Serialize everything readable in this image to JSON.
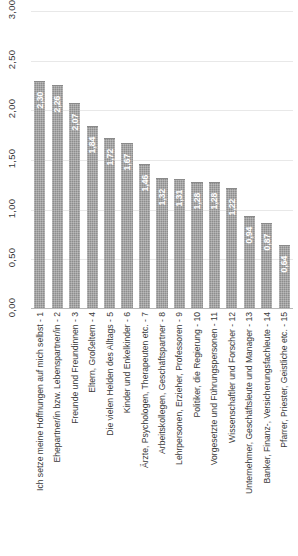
{
  "chart_data": {
    "type": "bar",
    "title": "",
    "xlabel": "",
    "ylabel": "",
    "ylim": [
      0,
      3
    ],
    "grid": true,
    "legend": "none",
    "decimal_separator": ",",
    "y_ticks": [
      "0,00",
      "0,50",
      "1,00",
      "1,50",
      "2,00",
      "2,50",
      "3,00"
    ],
    "y_tick_values": [
      0,
      0.5,
      1,
      1.5,
      2,
      2.5,
      3
    ],
    "categories": [
      "Ich setze meine Hoffnungen auf mich selbst - 1",
      "Ehepartner/in bzw. Lebenspartner/in - 2",
      "Freunde und Freundinnen - 3",
      "Eltern, Großeltern - 4",
      "Die vielen Helden des Alltags - 5",
      "Kinder und Enkelkinder - 6",
      "Ärzte, Psychologen, Therapeuten etc. - 7",
      "Arbeitskollegen, Geschäftspartner - 8",
      "Lehrpersonen, Erzieher, Professoren - 9",
      "Politiker, die Regierung - 10",
      "Vorgesetzte und Führungspersonen - 11",
      "Wissenschaftler und Forscher - 12",
      "Unternehmer, Geschäftsleute und Manager - 13",
      "Banker, Finanz-, Versicherungsfachleute - 14",
      "Pfarrer, Priester, Geistliche etc. - 15"
    ],
    "values": [
      2.3,
      2.26,
      2.07,
      1.84,
      1.72,
      1.67,
      1.46,
      1.32,
      1.31,
      1.28,
      1.28,
      1.22,
      0.94,
      0.87,
      0.64
    ],
    "value_labels": [
      "2,30",
      "2,26",
      "2,07",
      "1,84",
      "1,72",
      "1,67",
      "1,46",
      "1,32",
      "1,31",
      "1,28",
      "1,28",
      "1,22",
      "0,94",
      "0,87",
      "0,64"
    ],
    "colors": {
      "bar": "#8d8d8d",
      "gridline": "#e8e8e8",
      "baseline": "#b8b8b8",
      "value_label": "#ffffff",
      "axis_text": "#3a3a3a",
      "background": "#ffffff"
    }
  }
}
